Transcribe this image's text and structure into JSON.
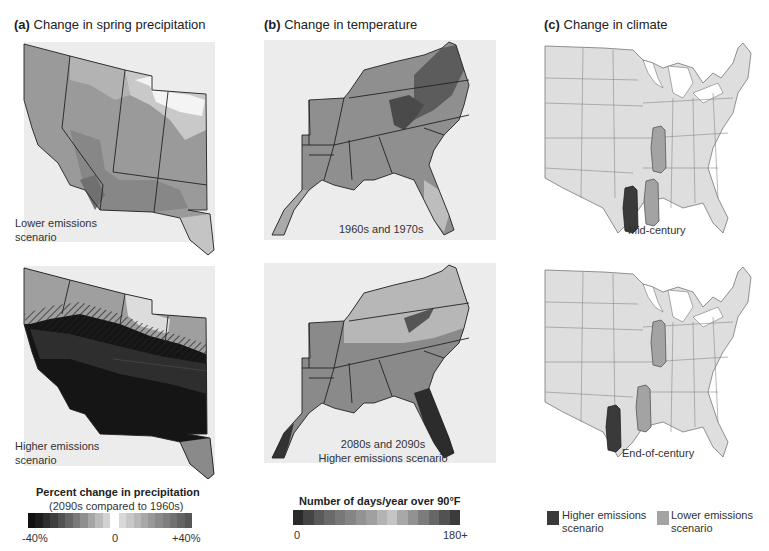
{
  "panels": {
    "a": {
      "letter": "(a)",
      "title": "Change in spring precipitation",
      "maps": [
        {
          "label_line1": "Lower emissions",
          "label_line2": "scenario"
        },
        {
          "label_line1": "Higher emissions",
          "label_line2": "scenario"
        }
      ],
      "legend": {
        "title": "Percent change in precipitation",
        "subtitle": "(2090s compared to 1960s)",
        "min_label": "-40%",
        "mid_label": "0",
        "max_label": "+40%",
        "neg_colors": [
          "#111111",
          "#1d1d1d",
          "#2e2e2e",
          "#3f3f3f",
          "#525252",
          "#666666",
          "#7a7a7a",
          "#8f8f8f",
          "#a5a5a5",
          "#bbbbbb",
          "#d2d2d2"
        ],
        "pos_colors": [
          "#d8d8d8",
          "#c8c8c8",
          "#b8b8b8",
          "#a8a8a8",
          "#999999",
          "#8b8b8b",
          "#7e7e7e",
          "#717171",
          "#636363",
          "#565656"
        ]
      }
    },
    "b": {
      "letter": "(b)",
      "title": "Change in temperature",
      "maps": [
        {
          "label_line1": "1960s and 1970s",
          "label_line2": ""
        },
        {
          "label_line1": "2080s and 2090s",
          "label_line2": "Higher emissions scenario"
        }
      ],
      "legend": {
        "title": "Number of days/year over 90°F",
        "min_label": "0",
        "max_label": "180+",
        "colors": [
          "#2a2a2a",
          "#444444",
          "#5a5a5a",
          "#6a6a6a",
          "#787878",
          "#858585",
          "#939393",
          "#a0a0a0",
          "#b3b3b3",
          "#c4c4c4",
          "#a8a8a8",
          "#929292",
          "#7c7c7c",
          "#676767",
          "#525252",
          "#3b3b3b"
        ]
      }
    },
    "c": {
      "letter": "(c)",
      "title": "Change in climate",
      "maps": [
        {
          "label_line1": "Mid-century"
        },
        {
          "label_line1": "End-of-century"
        }
      ],
      "legend": {
        "items": [
          {
            "label_line1": "Higher emissions",
            "label_line2": "scenario",
            "color": "#3a3a3a"
          },
          {
            "label_line1": "Lower emissions",
            "label_line2": "scenario",
            "color": "#a3a3a3"
          }
        ]
      }
    }
  },
  "colors": {
    "background": "#ffffff",
    "map_bg": "#ececec",
    "us_fill": "#dedede",
    "state_stroke": "#888888",
    "higher_scenario": "#3a3a3a",
    "lower_scenario": "#a3a3a3"
  }
}
